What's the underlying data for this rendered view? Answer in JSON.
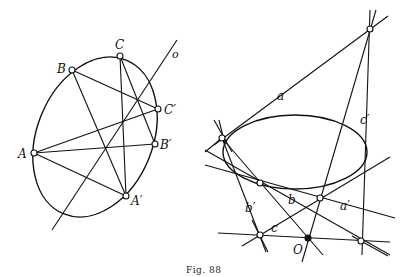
{
  "caption": "Fig. 88",
  "left_figure": {
    "points": {
      "A": "A",
      "B": "B",
      "C": "C",
      "A_prime": "A′",
      "B_prime": "B′",
      "C_prime": "C′"
    },
    "axis_label": "o"
  },
  "right_figure": {
    "lines": {
      "a": "a",
      "b": "b",
      "c": "c",
      "a_prime": "a′",
      "b_prime": "b′",
      "c_prime": "c′"
    },
    "center_label": "O"
  }
}
